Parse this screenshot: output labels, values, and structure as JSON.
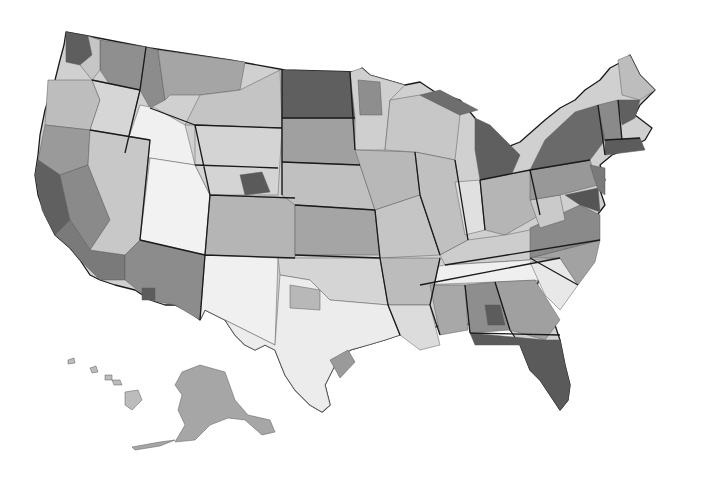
{
  "map": {
    "type": "choropleth",
    "subject": "United States subregions (grayscale shaded)",
    "legend": null,
    "labels": [],
    "shade_scale": {
      "lightest": "#f2f2f2",
      "light": "#d9d9d9",
      "medium_light": "#c2c2c2",
      "medium": "#a8a8a8",
      "medium_dark": "#8c8c8c",
      "dark": "#6e6e6e",
      "darkest": "#4f4f4f"
    },
    "border_color": "#1a1a1a",
    "background": "#ffffff",
    "insets": [
      "Alaska",
      "Hawaii"
    ]
  }
}
